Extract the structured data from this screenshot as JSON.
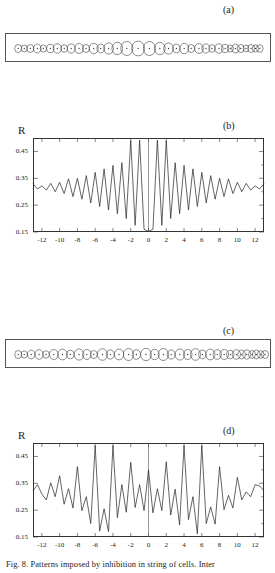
{
  "figure": {
    "caption": "Fig. 8. Patterns imposed by inhibition in string of cells. Inter"
  },
  "panels": [
    {
      "id": "a",
      "label": "(a)",
      "type": "cell-string"
    },
    {
      "id": "b",
      "label": "(b)",
      "type": "chart"
    },
    {
      "id": "c",
      "label": "(c)",
      "type": "cell-string"
    },
    {
      "id": "d",
      "label": "(d)",
      "type": "chart"
    }
  ],
  "cell_string_a": {
    "radii": [
      4.0,
      3.4,
      4.0,
      4.4,
      3.6,
      4.2,
      4.8,
      3.8,
      4.6,
      5.0,
      4.0,
      5.2,
      4.4,
      5.6,
      6.2,
      7.0,
      7.4,
      7.0,
      6.2,
      5.6,
      4.4,
      5.2,
      4.0,
      5.0,
      4.6,
      3.8,
      4.8,
      4.2,
      3.6,
      4.4,
      4.0,
      3.4,
      4.0,
      3.6,
      3.8
    ],
    "centers": [
      14,
      21,
      28,
      36,
      43,
      51,
      59,
      67,
      75,
      84,
      92,
      101,
      109,
      118,
      128,
      139,
      152,
      165,
      177,
      187,
      196,
      205,
      213,
      222,
      230,
      237,
      245,
      252,
      258,
      264,
      270,
      276,
      282,
      287,
      292
    ]
  },
  "cell_string_c": {
    "radii": [
      4.0,
      3.6,
      4.4,
      4.8,
      3.8,
      5.0,
      5.4,
      4.2,
      5.6,
      5.0,
      4.0,
      5.8,
      4.6,
      5.4,
      6.0,
      4.8,
      6.2,
      5.2,
      6.0,
      4.6,
      5.6,
      5.0,
      5.8,
      4.4,
      5.4,
      4.8,
      5.0,
      4.2,
      4.8,
      4.4,
      4.6,
      4.0,
      4.4,
      3.8,
      4.0
    ],
    "centers": [
      14,
      21,
      29,
      38,
      46,
      55,
      65,
      74,
      84,
      93,
      101,
      111,
      120,
      130,
      141,
      150,
      161,
      171,
      181,
      190,
      200,
      209,
      218,
      226,
      235,
      243,
      251,
      258,
      265,
      271,
      277,
      283,
      288,
      293,
      298
    ]
  },
  "chart_data": [
    {
      "id": "b",
      "type": "line",
      "title": "",
      "panel_label": "(b)",
      "xlabel": "",
      "ylabel": "R",
      "xlim": [
        -13,
        13
      ],
      "ylim": [
        0.15,
        0.5
      ],
      "xticks": [
        -12,
        -10,
        -8,
        -6,
        -4,
        -2,
        0,
        2,
        4,
        6,
        8,
        10,
        12
      ],
      "xticklabels": [
        "-12",
        "-10",
        "-8",
        "-6",
        "-4",
        "-2",
        "0",
        "2",
        "4",
        "6",
        "8",
        "10",
        "12"
      ],
      "yticks": [
        0.15,
        0.25,
        0.35,
        0.45
      ],
      "yticklabels": [
        "0.15",
        "0.25",
        "0.35",
        "0.45"
      ],
      "grid": false,
      "legend": false,
      "x": [
        -13,
        -12.5,
        -12,
        -11.5,
        -11,
        -10.5,
        -10,
        -9.5,
        -9,
        -8.5,
        -8,
        -7.5,
        -7,
        -6.5,
        -6,
        -5.5,
        -5,
        -4.5,
        -4,
        -3.5,
        -3,
        -2.5,
        -2,
        -1.5,
        -1,
        -0.5,
        0,
        0.5,
        1,
        1.5,
        2,
        2.5,
        3,
        3.5,
        4,
        4.5,
        5,
        5.5,
        6,
        6.5,
        7,
        7.5,
        8,
        8.5,
        9,
        9.5,
        10,
        10.5,
        11,
        11.5,
        12,
        12.5,
        13
      ],
      "y": [
        0.33,
        0.31,
        0.322,
        0.306,
        0.331,
        0.3,
        0.335,
        0.293,
        0.348,
        0.282,
        0.35,
        0.272,
        0.36,
        0.258,
        0.372,
        0.245,
        0.385,
        0.232,
        0.398,
        0.218,
        0.408,
        0.2,
        0.49,
        0.175,
        0.492,
        0.16,
        0.152,
        0.16,
        0.492,
        0.175,
        0.49,
        0.2,
        0.408,
        0.218,
        0.398,
        0.232,
        0.385,
        0.245,
        0.372,
        0.258,
        0.36,
        0.272,
        0.35,
        0.282,
        0.348,
        0.293,
        0.335,
        0.3,
        0.331,
        0.306,
        0.322,
        0.31,
        0.33
      ]
    },
    {
      "id": "d",
      "type": "line",
      "title": "",
      "panel_label": "(d)",
      "xlabel": "",
      "ylabel": "R",
      "xlim": [
        -13,
        13
      ],
      "ylim": [
        0.15,
        0.5
      ],
      "xticks": [
        -12,
        -10,
        -8,
        -6,
        -4,
        -2,
        0,
        2,
        4,
        6,
        8,
        10,
        12
      ],
      "xticklabels": [
        "-12",
        "-10",
        "-8",
        "-6",
        "-4",
        "-2",
        "0",
        "2",
        "4",
        "6",
        "8",
        "10",
        "12"
      ],
      "yticks": [
        0.15,
        0.25,
        0.35,
        0.45
      ],
      "yticklabels": [
        "0.15",
        "0.25",
        "0.35",
        "0.45"
      ],
      "grid": false,
      "legend": false,
      "x": [
        -13,
        -12.5,
        -12,
        -11.5,
        -11,
        -10.5,
        -10,
        -9.5,
        -9,
        -8.5,
        -8,
        -7.5,
        -7,
        -6.5,
        -6,
        -5.5,
        -5,
        -4.5,
        -4,
        -3.5,
        -3,
        -2.5,
        -2,
        -1.5,
        -1,
        -0.5,
        0,
        0.5,
        1,
        1.5,
        2,
        2.5,
        3,
        3.5,
        4,
        4.5,
        5,
        5.5,
        6,
        6.5,
        7,
        7.5,
        8,
        8.5,
        9,
        9.5,
        10,
        10.5,
        11,
        11.5,
        12,
        12.5,
        13
      ],
      "y": [
        0.322,
        0.345,
        0.31,
        0.288,
        0.352,
        0.3,
        0.378,
        0.272,
        0.33,
        0.258,
        0.412,
        0.248,
        0.3,
        0.2,
        0.49,
        0.172,
        0.255,
        0.17,
        0.49,
        0.222,
        0.345,
        0.242,
        0.428,
        0.26,
        0.345,
        0.248,
        0.4,
        0.24,
        0.33,
        0.248,
        0.43,
        0.232,
        0.328,
        0.195,
        0.49,
        0.215,
        0.3,
        0.162,
        0.49,
        0.2,
        0.262,
        0.198,
        0.412,
        0.252,
        0.305,
        0.258,
        0.372,
        0.288,
        0.318,
        0.3,
        0.345,
        0.34,
        0.322
      ]
    }
  ]
}
